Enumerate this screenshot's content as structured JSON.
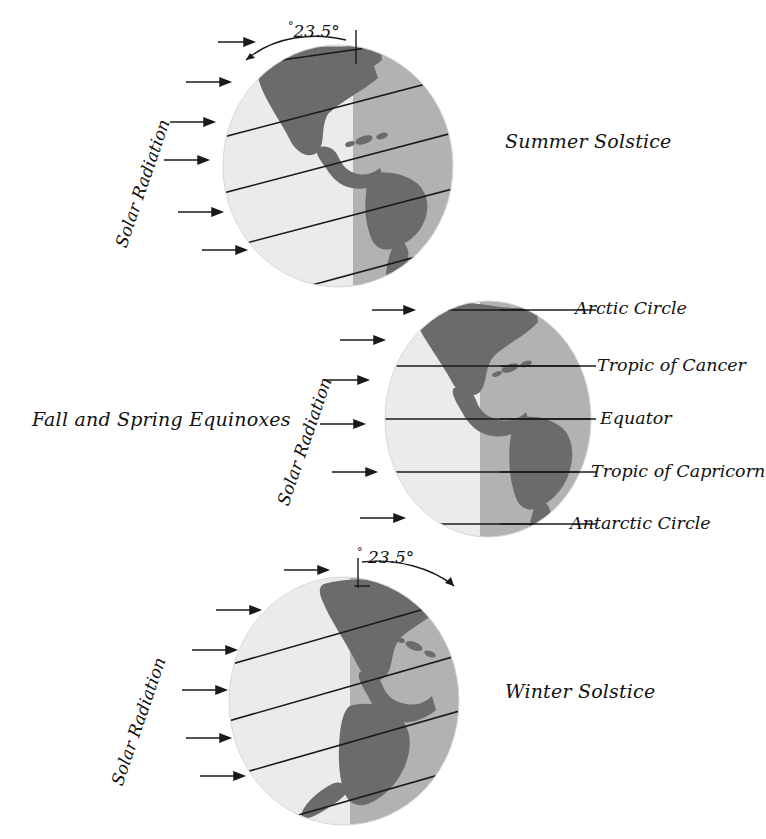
{
  "figure": {
    "colors": {
      "lit_hemisphere": "#ebebeb",
      "dark_hemisphere": "#b2b2b2",
      "continent": "#6b6b6b",
      "continent_dark": "#5e5e5e",
      "line": "#1a1a1a",
      "background": "#ffffff",
      "text": "#111111"
    }
  },
  "panels": [
    {
      "id": "summer",
      "caption": "Summer Solstice",
      "solar_label": "Solar Radiation",
      "tilt_value": "23.5",
      "tilt_degree_symbol": "°",
      "tilt_text": "23.5°",
      "tilt_direction": "toward-sun",
      "latitude_line_count": 5,
      "arrow_count": 6,
      "ray_direction": "left-to-right"
    },
    {
      "id": "equinox",
      "caption": "Fall and Spring Equinoxes",
      "solar_label": "Solar Radiation",
      "tilt_value": "0",
      "tilt_text": "",
      "tilt_direction": "none",
      "latitude_line_count": 5,
      "arrow_count": 6,
      "ray_direction": "left-to-right"
    },
    {
      "id": "winter",
      "caption": "Winter Solstice",
      "solar_label": "Solar Radiation",
      "tilt_value": "23.5",
      "tilt_degree_symbol": "°",
      "tilt_text": "23.5°",
      "tilt_direction": "away-from-sun",
      "latitude_line_count": 5,
      "arrow_count": 6,
      "ray_direction": "left-to-right"
    }
  ],
  "latitude_labels": [
    {
      "name": "Arctic Circle",
      "label": "Arctic Circle"
    },
    {
      "name": "Tropic of Cancer",
      "label": "Tropic of Cancer"
    },
    {
      "name": "Equator",
      "label": "Equator"
    },
    {
      "name": "Tropic of Capricorn",
      "label": "Tropic of Capricorn"
    },
    {
      "name": "Antarctic Circle",
      "label": "Antarctic Circle"
    }
  ]
}
